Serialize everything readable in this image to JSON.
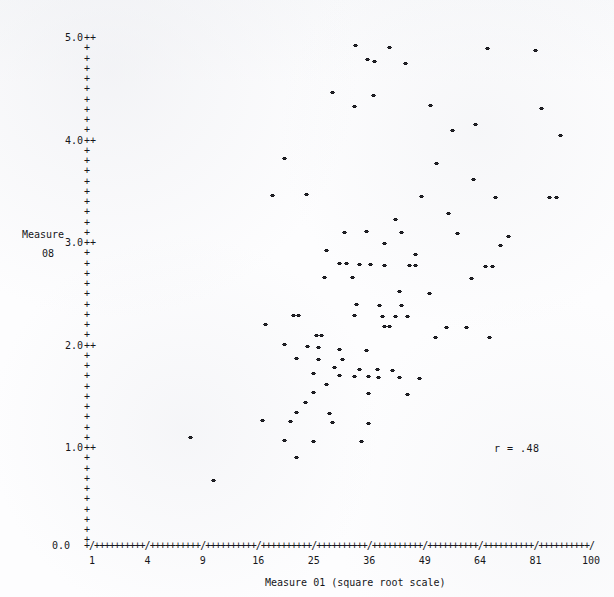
{
  "chart_data": {
    "type": "scatter",
    "title": "",
    "xlabel": "Measure 01 (square root scale)",
    "ylabel": "Measure 08",
    "ylabel_lines": [
      "Measure",
      "08"
    ],
    "annotation": "r = .48",
    "correlation": 0.48,
    "xscale": "square root",
    "xlim": [
      1,
      100
    ],
    "ylim": [
      0.0,
      5.0
    ],
    "grid": false,
    "legend": null,
    "x_tick_labels": [
      "1",
      "4",
      "9",
      "16",
      "25",
      "36",
      "49",
      "64",
      "81",
      "100"
    ],
    "x_tick_values": [
      1,
      4,
      9,
      16,
      25,
      36,
      49,
      64,
      81,
      100
    ],
    "y_tick_labels": [
      "0.0",
      "1.0",
      "2.0",
      "3.0",
      "4.0",
      "5.0"
    ],
    "y_tick_values": [
      0.0,
      1.0,
      2.0,
      3.0,
      4.0,
      5.0
    ],
    "y_minor_ticks_per_major": 10,
    "axis_tick_glyph": "+",
    "axis_major_glyph": "/",
    "point_glyph": "*",
    "points": [
      [
        33.8,
        4.88
      ],
      [
        41.1,
        4.86
      ],
      [
        67.0,
        4.85
      ],
      [
        81.8,
        4.83
      ],
      [
        36.2,
        4.74
      ],
      [
        37.8,
        4.72
      ],
      [
        45.0,
        4.7
      ],
      [
        29.0,
        4.42
      ],
      [
        37.5,
        4.39
      ],
      [
        33.5,
        4.28
      ],
      [
        51.3,
        4.29
      ],
      [
        84.0,
        4.26
      ],
      [
        63.5,
        4.11
      ],
      [
        57.0,
        4.05
      ],
      [
        90.2,
        4.0
      ],
      [
        20.5,
        3.78
      ],
      [
        52.8,
        3.73
      ],
      [
        63.0,
        3.57
      ],
      [
        18.5,
        3.42
      ],
      [
        24.2,
        3.43
      ],
      [
        49.0,
        3.41
      ],
      [
        69.5,
        3.4
      ],
      [
        86.5,
        3.4
      ],
      [
        89.0,
        3.4
      ],
      [
        56.0,
        3.24
      ],
      [
        42.5,
        3.18
      ],
      [
        31.5,
        3.06
      ],
      [
        36.0,
        3.07
      ],
      [
        44.0,
        3.06
      ],
      [
        58.5,
        3.05
      ],
      [
        73.5,
        3.02
      ],
      [
        40.0,
        2.95
      ],
      [
        71.0,
        2.93
      ],
      [
        28.0,
        2.88
      ],
      [
        47.5,
        2.84
      ],
      [
        30.5,
        2.75
      ],
      [
        31.8,
        2.75
      ],
      [
        34.5,
        2.74
      ],
      [
        37.0,
        2.74
      ],
      [
        40.0,
        2.73
      ],
      [
        46.0,
        2.73
      ],
      [
        47.5,
        2.73
      ],
      [
        66.5,
        2.72
      ],
      [
        68.5,
        2.72
      ],
      [
        27.5,
        2.62
      ],
      [
        33.0,
        2.62
      ],
      [
        62.5,
        2.61
      ],
      [
        43.5,
        2.48
      ],
      [
        51.0,
        2.46
      ],
      [
        34.0,
        2.35
      ],
      [
        39.0,
        2.34
      ],
      [
        44.0,
        2.34
      ],
      [
        22.0,
        2.25
      ],
      [
        22.8,
        2.25
      ],
      [
        33.5,
        2.25
      ],
      [
        39.5,
        2.24
      ],
      [
        42.5,
        2.24
      ],
      [
        45.5,
        2.24
      ],
      [
        17.5,
        2.16
      ],
      [
        40.0,
        2.14
      ],
      [
        41.3,
        2.14
      ],
      [
        55.5,
        2.13
      ],
      [
        61.0,
        2.13
      ],
      [
        26.0,
        2.05
      ],
      [
        27.0,
        2.05
      ],
      [
        52.5,
        2.03
      ],
      [
        67.5,
        2.03
      ],
      [
        20.5,
        1.96
      ],
      [
        24.5,
        1.94
      ],
      [
        26.5,
        1.93
      ],
      [
        30.5,
        1.92
      ],
      [
        36.0,
        1.91
      ],
      [
        22.5,
        1.83
      ],
      [
        26.5,
        1.82
      ],
      [
        31.0,
        1.82
      ],
      [
        29.5,
        1.74
      ],
      [
        34.5,
        1.72
      ],
      [
        38.5,
        1.72
      ],
      [
        42.0,
        1.71
      ],
      [
        25.5,
        1.68
      ],
      [
        30.5,
        1.66
      ],
      [
        33.5,
        1.65
      ],
      [
        36.5,
        1.65
      ],
      [
        38.8,
        1.64
      ],
      [
        43.5,
        1.64
      ],
      [
        48.5,
        1.63
      ],
      [
        28.0,
        1.57
      ],
      [
        25.5,
        1.5
      ],
      [
        36.5,
        1.49
      ],
      [
        45.5,
        1.48
      ],
      [
        24.0,
        1.4
      ],
      [
        22.5,
        1.3
      ],
      [
        28.5,
        1.29
      ],
      [
        17.0,
        1.22
      ],
      [
        21.5,
        1.21
      ],
      [
        29.0,
        1.2
      ],
      [
        36.5,
        1.19
      ],
      [
        8.0,
        1.06
      ],
      [
        20.5,
        1.03
      ],
      [
        25.5,
        1.02
      ],
      [
        35.0,
        1.02
      ],
      [
        22.5,
        0.86
      ],
      [
        10.5,
        0.64
      ]
    ]
  }
}
